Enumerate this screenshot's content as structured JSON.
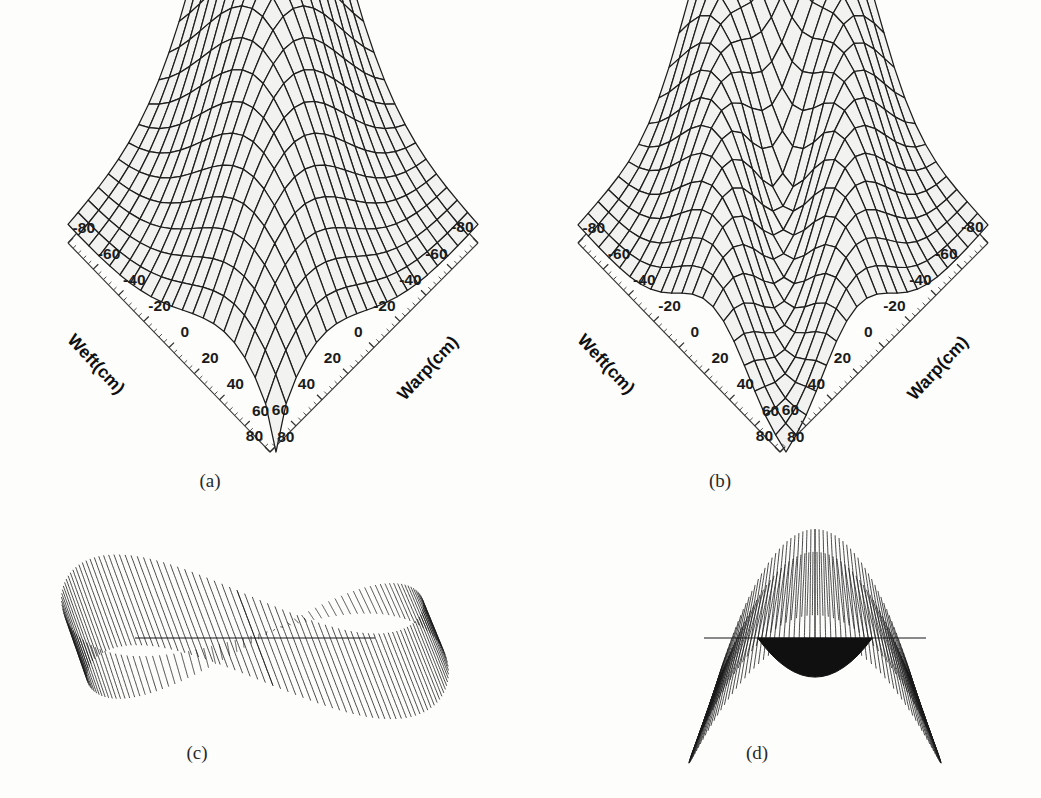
{
  "figure": {
    "background": "#fdfdfc",
    "ink": "#1d1d1d",
    "width": 1041,
    "height": 798
  },
  "panels": [
    {
      "id": "a",
      "caption": "(a)",
      "kind": "surface3d",
      "caption_x": 210,
      "caption_y": 470,
      "origin_x": 10,
      "origin_y": 18,
      "diamond": {
        "top_x": 270,
        "top_y": 16,
        "left_x": 68,
        "left_y": 243,
        "bottom_x": 270,
        "bottom_y": 452,
        "right_x": 478,
        "right_y": 243
      },
      "axes": {
        "left": {
          "title": "Weft(cm)",
          "title_x": 92,
          "title_y": 368,
          "title_rot": 47,
          "ticks": [
            -80,
            -60,
            -40,
            -20,
            0,
            20,
            40,
            60,
            80
          ],
          "labels": [
            "-80",
            "-60",
            "-40",
            "-20",
            "0",
            "20",
            "40",
            "60",
            "80"
          ],
          "minor_per_interval": 4
        },
        "right": {
          "title": "Warp(cm)",
          "title_x": 432,
          "title_y": 372,
          "title_rot": -47,
          "ticks": [
            -80,
            -60,
            -40,
            -20,
            0,
            20,
            40,
            60,
            80
          ],
          "labels": [
            "-80",
            "-60",
            "-40",
            "-20",
            "0",
            "20",
            "40",
            "60",
            "80"
          ],
          "minor_per_interval": 4
        }
      },
      "surface": {
        "type": "single-peak-tent",
        "grid_u": 21,
        "grid_v": 21,
        "description": "Tall narrow single-ridge draped fabric surface peaking at rear apex and tapering to a sharp point at the near corner",
        "peak_height": 1.0,
        "ridge_count": 1
      }
    },
    {
      "id": "b",
      "caption": "(b)",
      "kind": "surface3d",
      "caption_x": 720,
      "caption_y": 470,
      "origin_x": 520,
      "origin_y": 18,
      "diamond": {
        "top_x": 780,
        "top_y": 16,
        "left_x": 578,
        "left_y": 243,
        "bottom_x": 780,
        "bottom_y": 452,
        "right_x": 988,
        "right_y": 243
      },
      "axes": {
        "left": {
          "title": "Weft(cm)",
          "title_x": 602,
          "title_y": 368,
          "title_rot": 47,
          "ticks": [
            -80,
            -60,
            -40,
            -20,
            0,
            20,
            40,
            60,
            80
          ],
          "labels": [
            "-80",
            "-60",
            "-40",
            "-20",
            "0",
            "20",
            "40",
            "60",
            "80"
          ],
          "minor_per_interval": 4
        },
        "right": {
          "title": "Warp(cm)",
          "title_x": 942,
          "title_y": 372,
          "title_rot": -47,
          "ticks": [
            -80,
            -60,
            -40,
            -20,
            0,
            20,
            40,
            60,
            80
          ],
          "labels": [
            "-80",
            "-60",
            "-40",
            "-20",
            "0",
            "20",
            "40",
            "60",
            "80"
          ],
          "minor_per_interval": 4
        }
      },
      "surface": {
        "type": "twin-ridge-valley",
        "grid_u": 21,
        "grid_v": 21,
        "description": "Draped fabric surface with a central longitudinal valley separating two flanking ridges and flared skirts at the near corner",
        "peak_height": 1.0,
        "ridge_count": 2
      }
    },
    {
      "id": "c",
      "caption": "(c)",
      "kind": "ribbon",
      "caption_x": 197,
      "caption_y": 742,
      "center_x": 255,
      "center_y": 628,
      "width": 400,
      "height": 230,
      "surface": {
        "type": "figure-eight-mobius",
        "lobes": 2,
        "line_count": 150,
        "description": "Two interlocking ribbon lobes forming a horizontal figure-eight with a flat central seam line"
      }
    },
    {
      "id": "d",
      "caption": "(d)",
      "kind": "ribbon",
      "caption_x": 757,
      "caption_y": 742,
      "center_x": 815,
      "center_y": 628,
      "width": 370,
      "height": 230,
      "surface": {
        "type": "butterfly-saddle",
        "lobes": 2,
        "line_count": 150,
        "description": "Two upswept ribbon wings joined by a dark crowded saddle valley at the centre with a flat seam line"
      }
    }
  ],
  "chart_data": {
    "type": "surface",
    "title": "",
    "panel_count": 4,
    "axis_x": {
      "label": "Warp(cm)",
      "ticks": [
        -80,
        -60,
        -40,
        -20,
        0,
        20,
        40,
        60,
        80
      ],
      "unit": "cm",
      "min": -80,
      "max": 80,
      "step": 20
    },
    "axis_y": {
      "label": "Weft(cm)",
      "ticks": [
        -80,
        -60,
        -40,
        -20,
        0,
        20,
        40,
        60,
        80
      ],
      "unit": "cm",
      "min": -80,
      "max": 80,
      "step": 20
    },
    "captions": [
      "(a)",
      "(b)",
      "(c)",
      "(d)"
    ],
    "grid": false,
    "legend": "none",
    "series": [
      {
        "name": "(a)",
        "form": "single-peak-tent",
        "ridges": 1
      },
      {
        "name": "(b)",
        "form": "twin-ridge-valley",
        "ridges": 2
      },
      {
        "name": "(c)",
        "form": "figure-eight-mobius",
        "lobes": 2
      },
      {
        "name": "(d)",
        "form": "butterfly-saddle",
        "lobes": 2
      }
    ]
  }
}
